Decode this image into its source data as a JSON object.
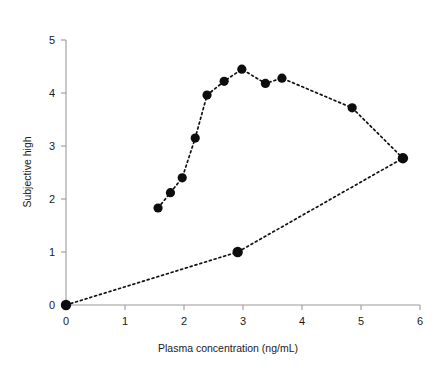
{
  "chart_data": {
    "type": "line",
    "title": "",
    "subtitle": "",
    "xlabel": "Plasma concentration (ng/mL)",
    "ylabel": "Subjective high",
    "xlim": [
      0,
      6
    ],
    "ylim": [
      0,
      5
    ],
    "xticks": [
      0,
      1,
      2,
      3,
      4,
      5,
      6
    ],
    "yticks": [
      0,
      1,
      2,
      3,
      4,
      5
    ],
    "xtick_labels": [
      "0",
      "1",
      "2",
      "3",
      "4",
      "5",
      "6"
    ],
    "ytick_labels": [
      "0",
      "1",
      "2",
      "3",
      "4",
      "5"
    ],
    "grid": false,
    "legend": null,
    "legend_position": "none",
    "annotations": [],
    "marker_style": "filled-circle",
    "line_style": "dotted",
    "line_color": "#111111",
    "marker_color": "#0d0d0d",
    "axis_color": "#9a9a9a",
    "background_color": "#ffffff",
    "series": [
      {
        "name": "hysteresis-loop",
        "points": [
          {
            "x": 0.0,
            "y": 0.0
          },
          {
            "x": 1.56,
            "y": 1.83
          },
          {
            "x": 1.77,
            "y": 2.12
          },
          {
            "x": 1.97,
            "y": 2.4
          },
          {
            "x": 2.19,
            "y": 3.15
          },
          {
            "x": 2.39,
            "y": 3.96
          },
          {
            "x": 2.68,
            "y": 4.22
          },
          {
            "x": 2.98,
            "y": 4.45
          },
          {
            "x": 3.38,
            "y": 4.18
          },
          {
            "x": 3.66,
            "y": 4.28
          },
          {
            "x": 4.85,
            "y": 3.72
          },
          {
            "x": 5.71,
            "y": 2.77
          },
          {
            "x": 2.91,
            "y": 1.0
          },
          {
            "x": 0.0,
            "y": 0.0
          }
        ]
      }
    ],
    "ascending_limb": {
      "name": "ascending-limb",
      "x": [
        1.56,
        1.77,
        1.97,
        2.19,
        2.39,
        2.68,
        2.98,
        3.38,
        3.66,
        4.85,
        5.71
      ],
      "y": [
        1.83,
        2.12,
        2.4,
        3.15,
        3.96,
        4.22,
        4.45,
        4.18,
        4.28,
        3.72,
        2.77
      ]
    },
    "descending_limb": {
      "name": "descending-limb",
      "x": [
        0.0,
        2.91,
        5.71
      ],
      "y": [
        0.0,
        1.0,
        2.77
      ]
    }
  },
  "layout": {
    "plot_left_px": 66,
    "plot_bottom_px": 305,
    "x_unit_px": 59,
    "y_unit_px": 53
  }
}
